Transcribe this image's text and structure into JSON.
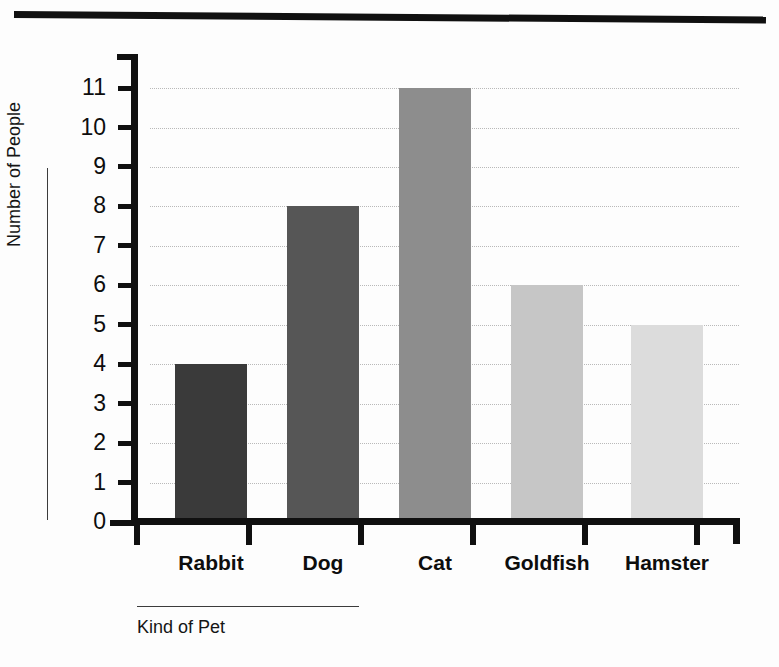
{
  "chart_data": {
    "type": "bar",
    "title": "",
    "subtitle": "",
    "xlabel": "Kind of Pet",
    "ylabel": "Number of People",
    "categories": [
      "Rabbit",
      "Dog",
      "Cat",
      "Goldfish",
      "Hamster"
    ],
    "values": [
      4,
      8,
      11,
      6,
      5
    ],
    "series": [
      {
        "name": "Number of People",
        "values": [
          4,
          8,
          11,
          6,
          5
        ]
      }
    ],
    "ylim": [
      0,
      11
    ],
    "ytick_labels": [
      "11",
      "10",
      "9",
      "8",
      "7",
      "6",
      "5",
      "4",
      "3",
      "2",
      "1",
      "0"
    ],
    "ytick_values": [
      11,
      10,
      9,
      8,
      7,
      6,
      5,
      4,
      3,
      2,
      1,
      0
    ],
    "grid": true,
    "grid_style": "dotted-horizontal",
    "legend": "none",
    "bar_colors": [
      "#3a3a3a",
      "#565656",
      "#8d8d8d",
      "#c6c6c6",
      "#dcdcdc"
    ],
    "axis_color": "#101010",
    "gridline_color": "#b9b9b9",
    "background": "#fdfdfd"
  },
  "decor": {
    "scanbar_color": "#101010"
  }
}
